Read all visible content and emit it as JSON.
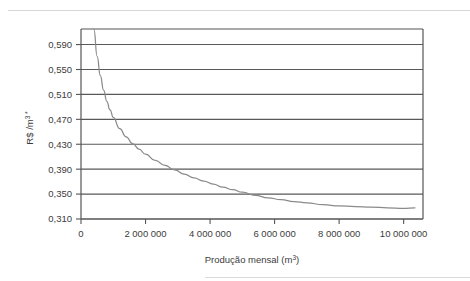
{
  "chart_data": {
    "type": "line",
    "title": "",
    "xlabel": "Produção mensal (m³)",
    "ylabel": "R$ /m³ *",
    "ylabel_parts": {
      "base": "R$ /m",
      "exponent": "3",
      "footnote_mark": "*"
    },
    "xlabel_parts": {
      "base": "Produção mensal (m",
      "exponent": "3",
      "close": ")"
    },
    "grid": true,
    "grid_axis": "y",
    "legend": "none",
    "xlim": [
      0,
      10600000
    ],
    "ylim": [
      0.31,
      0.615
    ],
    "ytick_labels": [
      "0,310",
      "0,350",
      "0,390",
      "0,430",
      "0,470",
      "0,510",
      "0,550",
      "0,590"
    ],
    "ytick_values": [
      0.31,
      0.35,
      0.39,
      0.43,
      0.47,
      0.51,
      0.55,
      0.59
    ],
    "xtick_labels": [
      "0",
      "2 000 000",
      "4 000 000",
      "6 000 000",
      "8 000 000",
      "10 000 000"
    ],
    "xtick_values": [
      0,
      2000000,
      4000000,
      6000000,
      8000000,
      10000000
    ],
    "series": [
      {
        "name": "Custo unitário",
        "color": "#8a8a8a",
        "x": [
          400000,
          500000,
          600000,
          700000,
          800000,
          900000,
          1000000,
          1200000,
          1400000,
          1600000,
          1800000,
          2000000,
          2300000,
          2600000,
          2900000,
          3200000,
          3500000,
          3800000,
          4100000,
          4400000,
          4700000,
          5000000,
          5400000,
          5800000,
          6200000,
          6600000,
          7000000,
          7500000,
          8000000,
          8500000,
          9000000,
          9500000,
          10000000,
          10350000
        ],
        "y": [
          0.615,
          0.571,
          0.54,
          0.517,
          0.499,
          0.485,
          0.473,
          0.455,
          0.442,
          0.431,
          0.422,
          0.414,
          0.404,
          0.396,
          0.389,
          0.382,
          0.376,
          0.371,
          0.366,
          0.361,
          0.357,
          0.353,
          0.348,
          0.344,
          0.341,
          0.338,
          0.336,
          0.333,
          0.331,
          0.33,
          0.329,
          0.328,
          0.327,
          0.328
        ]
      }
    ],
    "axis_color": "#555555",
    "grid_color": "#595959",
    "background_color": "#ffffff"
  }
}
